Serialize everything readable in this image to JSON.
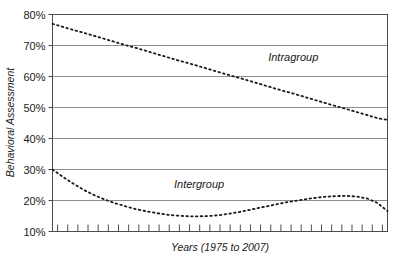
{
  "chart_data": {
    "type": "line",
    "title": "",
    "subtitle": "",
    "xlabel": "Years (1975 to 2007)",
    "ylabel": "Behavioral Assessment",
    "ylim": [
      10,
      80
    ],
    "xlim": [
      1975,
      2007
    ],
    "y_tick_labels": [
      "80%",
      "70%",
      "60%",
      "50%",
      "40%",
      "30%",
      "20%",
      "10%"
    ],
    "y_ticks": [
      80,
      70,
      60,
      50,
      40,
      30,
      20,
      10
    ],
    "grid": "horizontal",
    "legend_position": "inline-annotation",
    "line_style": "dotted",
    "line_color": "#1a1a1a",
    "grid_color": "#8c8c8c",
    "frame_color": "#4d4d4d",
    "x_tick_count": 33,
    "x_tick_labels_shown": false,
    "x": [
      1975,
      1976,
      1977,
      1978,
      1979,
      1980,
      1981,
      1982,
      1983,
      1984,
      1985,
      1986,
      1987,
      1988,
      1989,
      1990,
      1991,
      1992,
      1993,
      1994,
      1995,
      1996,
      1997,
      1998,
      1999,
      2000,
      2001,
      2002,
      2003,
      2004,
      2005,
      2006,
      2007
    ],
    "series": [
      {
        "name": "Intragroup",
        "label": "Intragroup",
        "label_x": 1998,
        "label_y": 65,
        "values": [
          77.0,
          76.0,
          75.0,
          74.1,
          73.1,
          72.1,
          71.1,
          70.1,
          69.2,
          68.2,
          67.2,
          66.2,
          65.2,
          64.3,
          63.3,
          62.3,
          61.3,
          60.3,
          59.4,
          58.4,
          57.4,
          56.4,
          55.4,
          54.5,
          53.5,
          52.5,
          51.5,
          50.5,
          49.6,
          48.6,
          47.6,
          46.6,
          46.0
        ]
      },
      {
        "name": "Intergroup",
        "label": "Intergroup",
        "label_x": 1989,
        "label_y": 24,
        "values": [
          30.0,
          27.6,
          25.4,
          23.4,
          21.7,
          20.3,
          19.1,
          18.1,
          17.2,
          16.5,
          15.9,
          15.4,
          15.1,
          14.9,
          14.9,
          15.0,
          15.3,
          15.8,
          16.4,
          17.1,
          17.8,
          18.5,
          19.2,
          19.8,
          20.3,
          20.8,
          21.2,
          21.4,
          21.5,
          21.3,
          20.7,
          19.3,
          16.6
        ]
      }
    ]
  },
  "annotations": {
    "y_axis_title": "Behavioral Assessment",
    "x_axis_title": "Years (1975 to 2007)"
  }
}
